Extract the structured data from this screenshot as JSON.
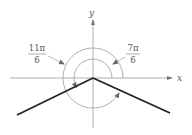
{
  "diagram": {
    "axes": {
      "x_label": "x",
      "y_label": "y"
    },
    "angles": [
      {
        "numerator": "11π",
        "denominator": "6"
      },
      {
        "numerator": "7π",
        "denominator": "6"
      }
    ],
    "colors": {
      "axis": "#9a9a9a",
      "arc": "#9a9a9a",
      "terminal_side": "#222222",
      "text": "#555555"
    }
  }
}
